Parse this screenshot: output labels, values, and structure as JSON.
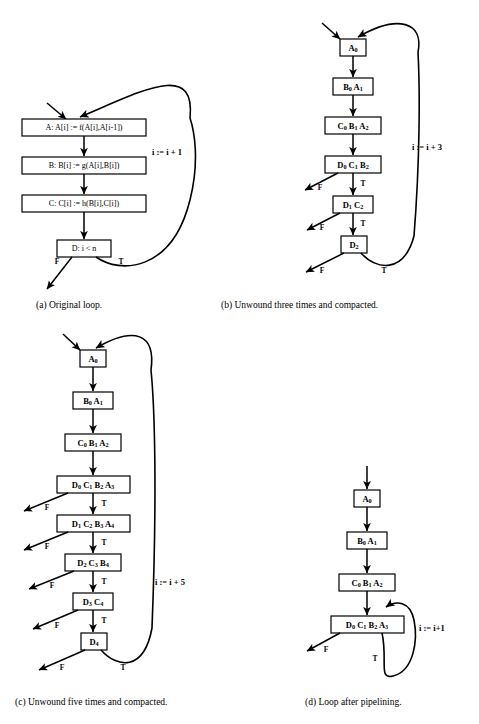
{
  "figure": {
    "type": "diagram",
    "panels": [
      {
        "id": "a",
        "caption": "(a) Original loop.",
        "loop_label": "i := i + 1",
        "nodes": [
          {
            "id": "A",
            "text": "A:  A[i] := f(A[i],A[i-1])"
          },
          {
            "id": "B",
            "text": "B:  B[i] := g(A[i],B[i])"
          },
          {
            "id": "C",
            "text": "C:  C[i] := h(B[i],C[i])"
          },
          {
            "id": "D",
            "text": "D:  i < n"
          }
        ],
        "branch_labels": [
          "F",
          "T"
        ]
      },
      {
        "id": "b",
        "caption": "(b) Unwound three times and compacted.",
        "loop_label": "i := i + 3",
        "nodes": [
          {
            "id": "b0",
            "ops": [
              {
                "op": "A",
                "sub": "0"
              }
            ]
          },
          {
            "id": "b1",
            "ops": [
              {
                "op": "B",
                "sub": "0"
              },
              {
                "op": "A",
                "sub": "1"
              }
            ]
          },
          {
            "id": "b2",
            "ops": [
              {
                "op": "C",
                "sub": "0"
              },
              {
                "op": "B",
                "sub": "1"
              },
              {
                "op": "A",
                "sub": "2"
              }
            ]
          },
          {
            "id": "b3",
            "ops": [
              {
                "op": "D",
                "sub": "0"
              },
              {
                "op": "C",
                "sub": "1"
              },
              {
                "op": "B",
                "sub": "2"
              }
            ]
          },
          {
            "id": "b4",
            "ops": [
              {
                "op": "D",
                "sub": "1"
              },
              {
                "op": "C",
                "sub": "2"
              }
            ]
          },
          {
            "id": "b5",
            "ops": [
              {
                "op": "D",
                "sub": "2"
              }
            ]
          }
        ],
        "branch_labels": [
          "F",
          "T"
        ]
      },
      {
        "id": "c",
        "caption": "(c) Unwound five times and compacted.",
        "loop_label": "i := i + 5",
        "nodes": [
          {
            "id": "c0",
            "ops": [
              {
                "op": "A",
                "sub": "0"
              }
            ]
          },
          {
            "id": "c1",
            "ops": [
              {
                "op": "B",
                "sub": "0"
              },
              {
                "op": "A",
                "sub": "1"
              }
            ]
          },
          {
            "id": "c2",
            "ops": [
              {
                "op": "C",
                "sub": "0"
              },
              {
                "op": "B",
                "sub": "1"
              },
              {
                "op": "A",
                "sub": "2"
              }
            ]
          },
          {
            "id": "c3",
            "ops": [
              {
                "op": "D",
                "sub": "0"
              },
              {
                "op": "C",
                "sub": "1"
              },
              {
                "op": "B",
                "sub": "2"
              },
              {
                "op": "A",
                "sub": "3"
              }
            ]
          },
          {
            "id": "c4",
            "ops": [
              {
                "op": "D",
                "sub": "1"
              },
              {
                "op": "C",
                "sub": "2"
              },
              {
                "op": "B",
                "sub": "3"
              },
              {
                "op": "A",
                "sub": "4"
              }
            ]
          },
          {
            "id": "c5",
            "ops": [
              {
                "op": "D",
                "sub": "2"
              },
              {
                "op": "C",
                "sub": "3"
              },
              {
                "op": "B",
                "sub": "4"
              }
            ]
          },
          {
            "id": "c6",
            "ops": [
              {
                "op": "D",
                "sub": "3"
              },
              {
                "op": "C",
                "sub": "4"
              }
            ]
          },
          {
            "id": "c7",
            "ops": [
              {
                "op": "D",
                "sub": "4"
              }
            ]
          }
        ],
        "branch_labels": [
          "F",
          "T"
        ]
      },
      {
        "id": "d",
        "caption": "(d) Loop after pipelining.",
        "loop_label": "i := i+1",
        "nodes": [
          {
            "id": "d0",
            "ops": [
              {
                "op": "A",
                "sub": "0"
              }
            ]
          },
          {
            "id": "d1",
            "ops": [
              {
                "op": "B",
                "sub": "0"
              },
              {
                "op": "A",
                "sub": "1"
              }
            ]
          },
          {
            "id": "d2",
            "ops": [
              {
                "op": "C",
                "sub": "0"
              },
              {
                "op": "B",
                "sub": "1"
              },
              {
                "op": "A",
                "sub": "2"
              }
            ]
          },
          {
            "id": "d3",
            "ops": [
              {
                "op": "D",
                "sub": "0"
              },
              {
                "op": "C",
                "sub": "1"
              },
              {
                "op": "B",
                "sub": "2"
              },
              {
                "op": "A",
                "sub": "3"
              }
            ]
          }
        ],
        "branch_labels": [
          "F",
          "T"
        ]
      }
    ]
  }
}
